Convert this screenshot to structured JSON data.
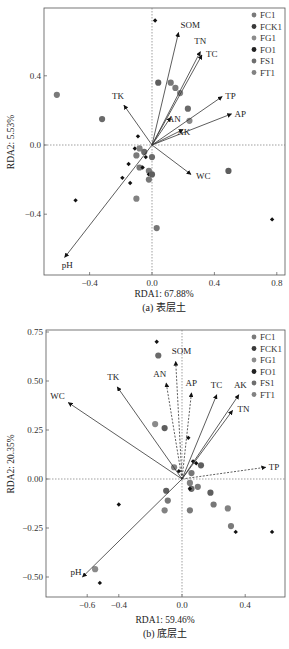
{
  "chart_data": [
    {
      "type": "scatter",
      "subtype": "rda-biplot",
      "caption": "(a) 表层土",
      "xlabel": "RDA1: 67.88%",
      "ylabel": "RDA2: 5.53%",
      "xlim": [
        -0.7,
        0.85
      ],
      "ylim": [
        -0.75,
        0.8
      ],
      "xticks": [
        -0.4,
        0.0,
        0.4,
        0.8
      ],
      "xtick_labels": [
        "−0.4",
        "0.0",
        "0.4",
        "0.8"
      ],
      "yticks": [
        -0.4,
        0.0,
        0.4
      ],
      "ytick_labels": [
        "−0.4",
        "0.0",
        "0.4"
      ],
      "grid": false,
      "zero_lines": true,
      "legend": {
        "position": "top-right",
        "entries": [
          {
            "name": "FC1",
            "color": "#7a7a7a"
          },
          {
            "name": "FCK1",
            "color": "#3a3a3a"
          },
          {
            "name": "FG1",
            "color": "#8c8c8c"
          },
          {
            "name": "FO1",
            "color": "#222222"
          },
          {
            "name": "FS1",
            "color": "#6e6e6e"
          },
          {
            "name": "FT1",
            "color": "#828282"
          }
        ]
      },
      "vectors": [
        {
          "name": "SOM",
          "x": 0.17,
          "y": 0.65,
          "style": "solid"
        },
        {
          "name": "TN",
          "x": 0.31,
          "y": 0.54,
          "style": "solid"
        },
        {
          "name": "TC",
          "x": 0.32,
          "y": 0.52,
          "style": "solid"
        },
        {
          "name": "TP",
          "x": 0.45,
          "y": 0.28,
          "style": "solid"
        },
        {
          "name": "AP",
          "x": 0.51,
          "y": 0.18,
          "style": "solid"
        },
        {
          "name": "AN",
          "x": 0.12,
          "y": 0.16,
          "style": "solid"
        },
        {
          "name": "AK",
          "x": 0.2,
          "y": 0.09,
          "style": "solid"
        },
        {
          "name": "TK",
          "x": -0.18,
          "y": 0.23,
          "style": "solid"
        },
        {
          "name": "WC",
          "x": 0.25,
          "y": -0.17,
          "style": "solid"
        },
        {
          "name": "pH",
          "x": -0.56,
          "y": -0.65,
          "style": "solid"
        }
      ],
      "points": [
        {
          "x": -0.61,
          "y": 0.29,
          "kind": "circle"
        },
        {
          "x": -0.32,
          "y": 0.15,
          "kind": "circle"
        },
        {
          "x": 0.02,
          "y": 0.72,
          "kind": "diamond"
        },
        {
          "x": 0.04,
          "y": 0.36,
          "kind": "circle"
        },
        {
          "x": 0.12,
          "y": 0.36,
          "kind": "circle"
        },
        {
          "x": 0.18,
          "y": 0.3,
          "kind": "circle"
        },
        {
          "x": 0.15,
          "y": 0.33,
          "kind": "circle"
        },
        {
          "x": 0.23,
          "y": 0.21,
          "kind": "circle"
        },
        {
          "x": 0.24,
          "y": 0.14,
          "kind": "circle"
        },
        {
          "x": -0.09,
          "y": 0.05,
          "kind": "diamond"
        },
        {
          "x": -0.11,
          "y": -0.02,
          "kind": "diamond"
        },
        {
          "x": -0.08,
          "y": -0.02,
          "kind": "circle"
        },
        {
          "x": -0.1,
          "y": -0.06,
          "kind": "circle"
        },
        {
          "x": -0.05,
          "y": -0.04,
          "kind": "circle"
        },
        {
          "x": -0.04,
          "y": -0.07,
          "kind": "diamond"
        },
        {
          "x": -0.15,
          "y": -0.11,
          "kind": "diamond"
        },
        {
          "x": -0.08,
          "y": -0.13,
          "kind": "circle"
        },
        {
          "x": -0.06,
          "y": -0.13,
          "kind": "diamond"
        },
        {
          "x": -0.02,
          "y": -0.15,
          "kind": "circle"
        },
        {
          "x": 0.0,
          "y": -0.07,
          "kind": "circle"
        },
        {
          "x": -0.02,
          "y": -0.17,
          "kind": "diamond"
        },
        {
          "x": 0.0,
          "y": -0.17,
          "kind": "circle"
        },
        {
          "x": -0.02,
          "y": -0.2,
          "kind": "circle"
        },
        {
          "x": -0.1,
          "y": -0.31,
          "kind": "circle"
        },
        {
          "x": -0.19,
          "y": -0.19,
          "kind": "diamond"
        },
        {
          "x": -0.14,
          "y": -0.22,
          "kind": "diamond"
        },
        {
          "x": -0.49,
          "y": -0.32,
          "kind": "diamond"
        },
        {
          "x": 0.49,
          "y": -0.15,
          "kind": "circle"
        },
        {
          "x": 0.03,
          "y": -0.48,
          "kind": "circle"
        },
        {
          "x": 0.77,
          "y": -0.43,
          "kind": "diamond"
        }
      ]
    },
    {
      "type": "scatter",
      "subtype": "rda-biplot",
      "caption": "(b) 底层土",
      "xlabel": "RDA1: 59.46%",
      "ylabel": "RDA2: 20.35%",
      "xlim": [
        -0.64,
        0.65
      ],
      "ylim": [
        -0.6,
        0.76
      ],
      "xticks": [
        -0.6,
        -0.4,
        0.0,
        0.4
      ],
      "xtick_labels": [
        "−0.6",
        "−0.4",
        "0.0",
        "0.4"
      ],
      "yticks": [
        -0.5,
        -0.25,
        0.0,
        0.25,
        0.5,
        0.75
      ],
      "ytick_labels": [
        "−0.50",
        "−0.25",
        "0.00",
        "0.25",
        "0.50",
        "0.75"
      ],
      "grid": false,
      "zero_lines": true,
      "legend": {
        "position": "top-right",
        "entries": [
          {
            "name": "FC1",
            "color": "#7a7a7a"
          },
          {
            "name": "FCK1",
            "color": "#3a3a3a"
          },
          {
            "name": "FG1",
            "color": "#8c8c8c"
          },
          {
            "name": "FO1",
            "color": "#222222"
          },
          {
            "name": "FS1",
            "color": "#6e6e6e"
          },
          {
            "name": "FT1",
            "color": "#828282"
          }
        ]
      },
      "vectors": [
        {
          "name": "WC",
          "x": -0.72,
          "y": 0.39,
          "style": "solid"
        },
        {
          "name": "TK",
          "x": -0.41,
          "y": 0.47,
          "style": "solid"
        },
        {
          "name": "SOM",
          "x": -0.04,
          "y": 0.6,
          "style": "dashed"
        },
        {
          "name": "AN",
          "x": -0.1,
          "y": 0.49,
          "style": "dashed"
        },
        {
          "name": "AP",
          "x": 0.06,
          "y": 0.44,
          "style": "dashed"
        },
        {
          "name": "TC",
          "x": 0.22,
          "y": 0.43,
          "style": "solid"
        },
        {
          "name": "AK",
          "x": 0.36,
          "y": 0.43,
          "style": "solid"
        },
        {
          "name": "TN",
          "x": 0.32,
          "y": 0.35,
          "style": "solid"
        },
        {
          "name": "TP",
          "x": 0.53,
          "y": 0.06,
          "style": "dashed"
        },
        {
          "name": "pH",
          "x": -0.63,
          "y": -0.5,
          "style": "solid"
        }
      ],
      "points": [
        {
          "x": -0.16,
          "y": 0.7,
          "kind": "diamond"
        },
        {
          "x": -0.15,
          "y": 0.63,
          "kind": "circle"
        },
        {
          "x": -0.17,
          "y": 0.28,
          "kind": "circle"
        },
        {
          "x": -0.11,
          "y": 0.26,
          "kind": "circle"
        },
        {
          "x": 0.04,
          "y": 0.21,
          "kind": "diamond"
        },
        {
          "x": -0.05,
          "y": 0.06,
          "kind": "circle"
        },
        {
          "x": -0.02,
          "y": 0.04,
          "kind": "diamond"
        },
        {
          "x": 0.07,
          "y": 0.09,
          "kind": "diamond"
        },
        {
          "x": 0.09,
          "y": 0.08,
          "kind": "diamond"
        },
        {
          "x": 0.12,
          "y": 0.07,
          "kind": "circle"
        },
        {
          "x": 0.06,
          "y": 0.03,
          "kind": "circle"
        },
        {
          "x": 0.05,
          "y": -0.02,
          "kind": "circle"
        },
        {
          "x": 0.1,
          "y": -0.04,
          "kind": "circle"
        },
        {
          "x": 0.06,
          "y": -0.05,
          "kind": "circle"
        },
        {
          "x": 0.05,
          "y": -0.05,
          "kind": "diamond"
        },
        {
          "x": 0.18,
          "y": -0.07,
          "kind": "circle"
        },
        {
          "x": 0.2,
          "y": -0.13,
          "kind": "circle"
        },
        {
          "x": 0.29,
          "y": -0.15,
          "kind": "circle"
        },
        {
          "x": 0.31,
          "y": -0.24,
          "kind": "circle"
        },
        {
          "x": 0.34,
          "y": -0.27,
          "kind": "diamond"
        },
        {
          "x": 0.57,
          "y": -0.27,
          "kind": "diamond"
        },
        {
          "x": -0.1,
          "y": -0.06,
          "kind": "circle"
        },
        {
          "x": -0.09,
          "y": -0.11,
          "kind": "circle"
        },
        {
          "x": -0.11,
          "y": -0.16,
          "kind": "circle"
        },
        {
          "x": 0.05,
          "y": -0.16,
          "kind": "circle"
        },
        {
          "x": -0.4,
          "y": -0.13,
          "kind": "diamond"
        },
        {
          "x": -0.55,
          "y": -0.46,
          "kind": "circle"
        },
        {
          "x": -0.52,
          "y": -0.53,
          "kind": "diamond"
        }
      ]
    }
  ]
}
